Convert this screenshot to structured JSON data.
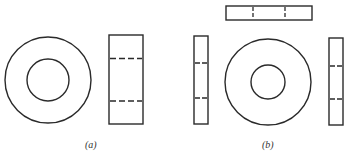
{
  "figure": {
    "panels": [
      {
        "id": "a",
        "label": "(a)",
        "views": [
          "front view: two concentric circles (washer/ring)",
          "side view: rectangle with two dashed hidden lines"
        ]
      },
      {
        "id": "b",
        "label": "(b)",
        "views": [
          "top view: horizontal rectangle with two dashed hidden lines",
          "left side view: narrow rectangle with two dashed hidden lines",
          "front view: two concentric circles",
          "right side view: narrow rectangle with two dashed hidden lines"
        ]
      }
    ],
    "colors": {
      "stroke": "#2a2a2a",
      "background": "#ffffff"
    }
  }
}
